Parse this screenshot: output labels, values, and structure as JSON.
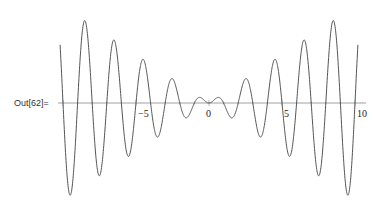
{
  "cell": {
    "out_label": "Out[62]="
  },
  "chart_data": {
    "type": "line",
    "title": "",
    "xlabel": "",
    "ylabel": "",
    "xlim": [
      -10.2,
      10.2
    ],
    "x_tick_labels": [
      "-5",
      "0",
      "5",
      "10"
    ],
    "grid": false,
    "legend": null,
    "note": "Generating function not shown in screenshot. Points below are estimates read from pixels; rendered curve is a visual approximation only.",
    "observed_shape": "even/symmetric oscillation, envelope growing roughly linearly with |x|, period approx 2 units, small central dip at x=0 flanked by small humps near x=+/-0.7",
    "approx_peaks_above_axis": [
      {
        "x": -9.1,
        "y_px_above_axis": 88
      },
      {
        "x": -6.9,
        "y_px_above_axis": 67
      },
      {
        "x": -4.9,
        "y_px_above_axis": 46
      },
      {
        "x": -2.8,
        "y_px_above_axis": 25
      },
      {
        "x": -0.7,
        "y_px_above_axis": 6
      },
      {
        "x": 0.7,
        "y_px_above_axis": 6
      },
      {
        "x": 2.8,
        "y_px_above_axis": 25
      },
      {
        "x": 4.9,
        "y_px_above_axis": 46
      },
      {
        "x": 6.9,
        "y_px_above_axis": 67
      },
      {
        "x": 9.1,
        "y_px_above_axis": 88
      }
    ]
  },
  "colors": {
    "curve": "#555555",
    "axis": "#888888",
    "text": "#222222"
  }
}
